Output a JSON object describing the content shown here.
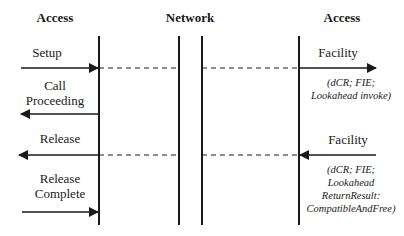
{
  "diagram": {
    "headers": {
      "left": "Access",
      "middle": "Network",
      "right": "Access"
    },
    "messages_left": [
      {
        "label": "Setup",
        "direction": "right"
      },
      {
        "label_line1": "Call",
        "label_line2": "Proceeding",
        "direction": "left"
      },
      {
        "label": "Release",
        "direction": "left"
      },
      {
        "label_line1": "Release",
        "label_line2": "Complete",
        "direction": "right"
      }
    ],
    "messages_right": [
      {
        "label": "Facility",
        "direction": "right",
        "params_line1": "(dCR; FIE;",
        "params_line2": "Lookahead invoke)"
      },
      {
        "label": "Facility",
        "direction": "left",
        "params_line1": "(dCR; FIE;",
        "params_line2": "Lookahead",
        "params_line3": "ReturnResult:",
        "params_line4": "CompatibleAndFree)"
      }
    ],
    "colors": {
      "line": "#1a1a1a",
      "background": "#ffffff"
    }
  }
}
